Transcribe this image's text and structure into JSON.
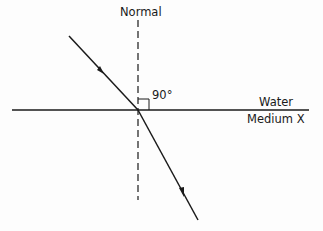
{
  "diagram": {
    "labels": {
      "normal": "Normal",
      "angle": "90°",
      "upper_medium": "Water",
      "lower_medium": "Medium X"
    },
    "colors": {
      "line": "#1a1a1a",
      "background": "#fdfdfd"
    }
  }
}
